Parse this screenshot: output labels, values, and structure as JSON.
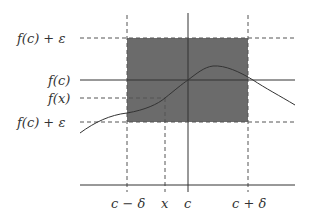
{
  "diagram": {
    "colors": {
      "shade": "#6b6b6b",
      "line": "#333333",
      "dashed": "#555555",
      "background": "#ffffff"
    },
    "y_labels": {
      "top": "f(c) + ε",
      "fc": "f(c)",
      "fx": "f(x)",
      "bottom": "f(c) + ε"
    },
    "x_labels": {
      "c_minus_delta": "c − δ",
      "x": "x",
      "c": "c",
      "c_plus_delta": "c + δ"
    },
    "geometry": {
      "x_c_minus_delta": 127,
      "x_x": 165,
      "x_c": 188,
      "x_c_plus_delta": 248,
      "y_top": 38,
      "y_fc": 80,
      "y_fx": 98,
      "y_bottom": 122,
      "y_axis": 185
    }
  }
}
